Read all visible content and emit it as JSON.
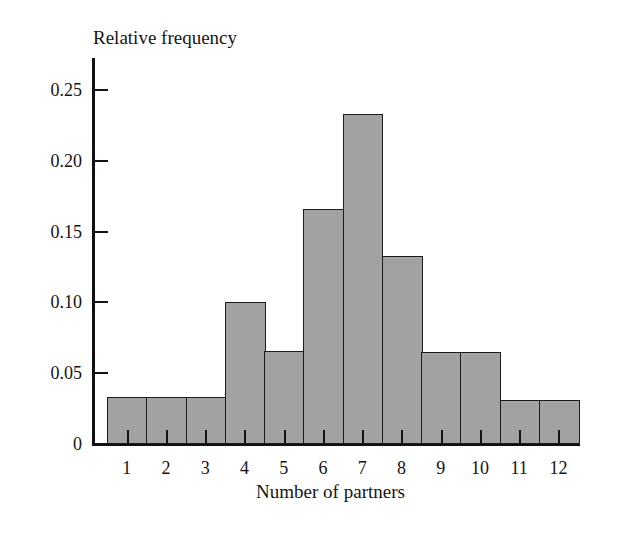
{
  "chart_data": {
    "type": "bar",
    "title": "",
    "xlabel": "Number of partners",
    "ylabel": "Relative frequency",
    "categories": [
      "1",
      "2",
      "3",
      "4",
      "5",
      "6",
      "7",
      "8",
      "9",
      "10",
      "11",
      "12"
    ],
    "values": [
      0.033,
      0.033,
      0.033,
      0.1,
      0.066,
      0.166,
      0.233,
      0.133,
      0.065,
      0.065,
      0.031,
      0.031
    ],
    "ylim": [
      0,
      0.265
    ],
    "ytick_values": [
      0,
      0.05,
      0.1,
      0.15,
      0.2,
      0.25
    ],
    "ytick_labels": [
      "0",
      "0.05",
      "0.10",
      "0.15",
      "0.20",
      "0.25"
    ],
    "grid": false,
    "legend": false,
    "legend_position": "none",
    "bar_fill_color": "#a2a2a2",
    "bar_edge_color": "#1c1c1c",
    "axis_color": "#111111",
    "background_color": "#ffffff"
  }
}
